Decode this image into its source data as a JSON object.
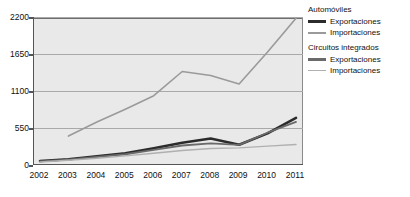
{
  "chart_data": {
    "type": "line",
    "title": "",
    "xlabel": "",
    "ylabel": "",
    "categories": [
      "2002",
      "2003",
      "2004",
      "2005",
      "2006",
      "2007",
      "2008",
      "2009",
      "2010",
      "2011"
    ],
    "ylim": [
      0,
      2200
    ],
    "yticks": [
      0,
      550,
      1100,
      1650,
      2200
    ],
    "grid": true,
    "legend_position": "right",
    "series": [
      {
        "name": "Automóviles - Exportaciones",
        "group": "Automóviles",
        "kind": "Exportaciones",
        "color": "#2b2b2b",
        "width": 2.6,
        "values": [
          60,
          85,
          130,
          175,
          250,
          330,
          395,
          300,
          470,
          700
        ]
      },
      {
        "name": "Automóviles - Importaciones",
        "group": "Automóviles",
        "kind": "Importaciones",
        "color": "#9a9a9a",
        "width": 1.6,
        "values": [
          null,
          430,
          640,
          830,
          1030,
          1390,
          1330,
          1205,
          1680,
          2180
        ]
      },
      {
        "name": "Circuitos integrados - Exportaciones",
        "group": "Circuitos integrados",
        "kind": "Exportaciones",
        "color": "#6a6a6a",
        "width": 1.8,
        "values": [
          55,
          80,
          120,
          160,
          225,
          290,
          320,
          300,
          480,
          640
        ]
      },
      {
        "name": "Circuitos integrados - Importaciones",
        "group": "Circuitos integrados",
        "kind": "Importaciones",
        "color": "#b0b0b0",
        "width": 1.4,
        "values": [
          45,
          70,
          100,
          135,
          175,
          215,
          245,
          255,
          280,
          305
        ]
      }
    ]
  },
  "legend": {
    "groups": [
      {
        "title": "Automóviles",
        "entries": [
          {
            "label": "Exportaciones",
            "style": "thick-dark"
          },
          {
            "label": "Importaciones",
            "style": "thin-gray"
          }
        ]
      },
      {
        "title": "Circuitos integrados",
        "entries": [
          {
            "label": "Exportaciones",
            "style": "thick-mid"
          },
          {
            "label": "Importaciones",
            "style": "thin-light"
          }
        ]
      }
    ]
  },
  "colors": {
    "plot_background": "#e9e9e9",
    "page_background": "#ffffff",
    "axis": "#555555",
    "gridline": "#a9a9a9",
    "text": "#111111"
  }
}
